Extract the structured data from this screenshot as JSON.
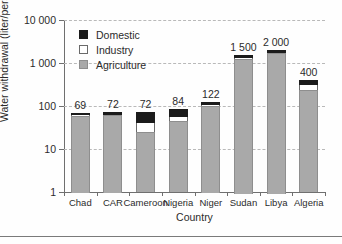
{
  "chart_data": {
    "type": "bar",
    "stacked": true,
    "title": "",
    "subtitle": "",
    "xlabel": "Country",
    "ylabel": "Water withdrawal (liter/person and day)",
    "yscale": "log",
    "ylim": [
      1,
      10000
    ],
    "ytick_labels": [
      "1",
      "10",
      "100",
      "1 000",
      "10 000"
    ],
    "ytick_values": [
      1,
      10,
      100,
      1000,
      10000
    ],
    "grid": true,
    "grid_axis": "y",
    "grid_style": "dashed",
    "legend_position": "upper-left-inside",
    "categories": [
      "Chad",
      "CAR",
      "Cameroon",
      "Nigeria",
      "Niger",
      "Sudan",
      "Libya",
      "Algeria"
    ],
    "totals": [
      69,
      72,
      72,
      84,
      122,
      1500,
      2000,
      400
    ],
    "total_labels": [
      "69",
      "72",
      "72",
      "84",
      "122",
      "1 500",
      "2 000",
      "400"
    ],
    "series": [
      {
        "name": "Agriculture",
        "color": "#a9a9a9",
        "values": [
          62,
          64,
          25,
          46,
          110,
          1390,
          1880,
          240
        ]
      },
      {
        "name": "Industry",
        "color": "#ffffff",
        "values": [
          1,
          1,
          15,
          11,
          2,
          30,
          40,
          70
        ]
      },
      {
        "name": "Domestic",
        "color": "#1b1b1b",
        "values": [
          6,
          7,
          32,
          27,
          10,
          80,
          80,
          90
        ]
      }
    ],
    "legend_entries": [
      {
        "label": "Domestic",
        "color": "#1b1b1b"
      },
      {
        "label": "Industry",
        "color": "#ffffff"
      },
      {
        "label": "Agriculture",
        "color": "#a9a9a9"
      }
    ]
  }
}
